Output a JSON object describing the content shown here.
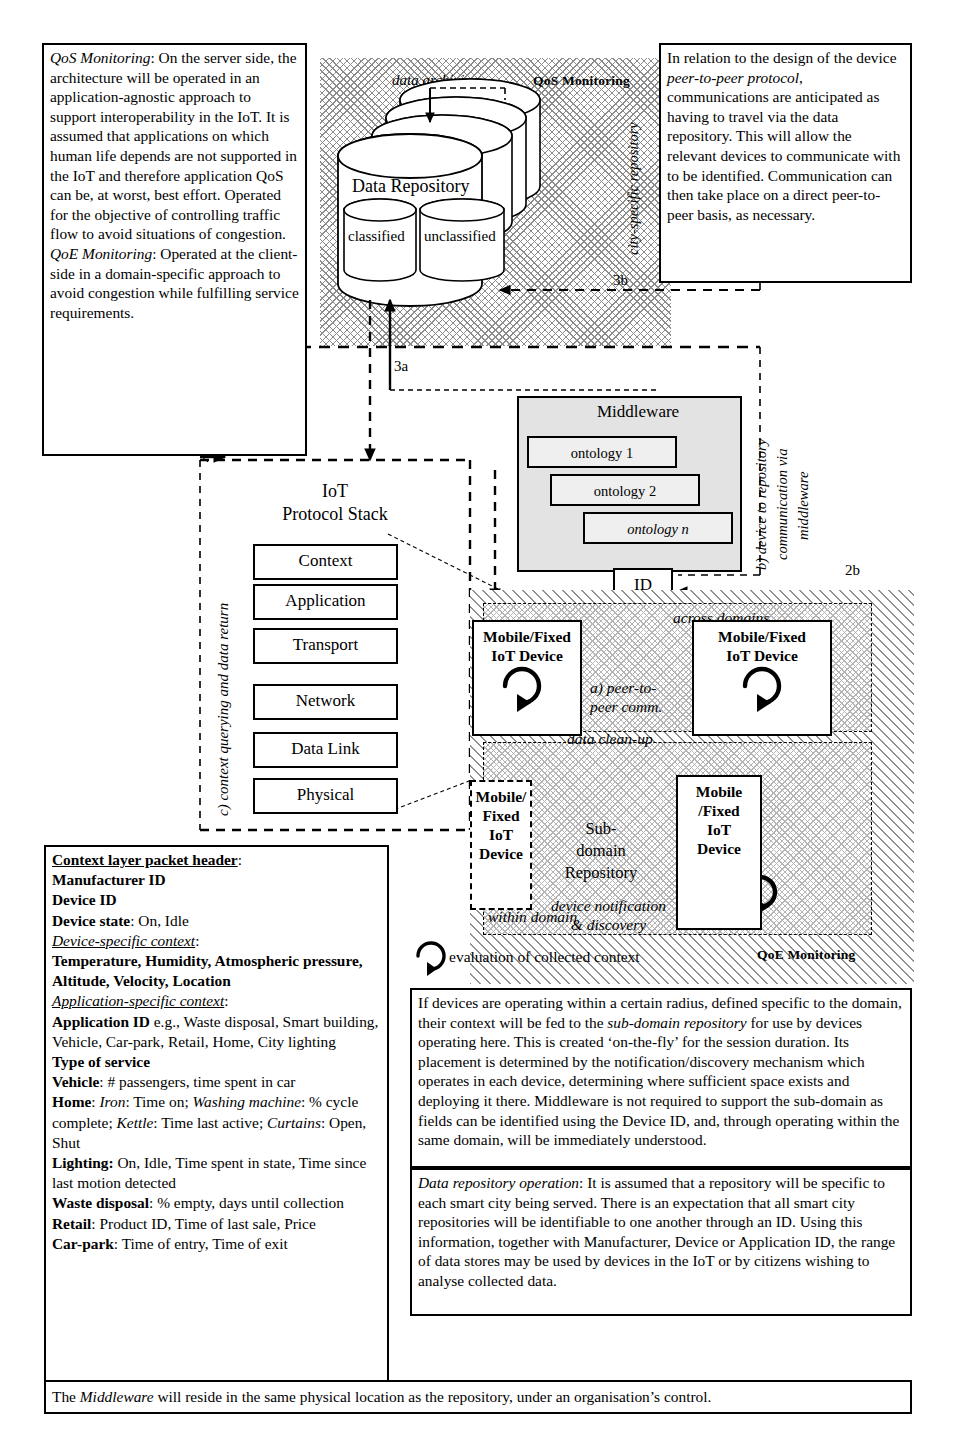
{
  "regions": {
    "qos_label": "QoS Monitoring",
    "qoe_label": "QoE Monitoring",
    "across_domains": "across domains",
    "within_domain": "within domain"
  },
  "repository": {
    "title": "Data Repository",
    "classified": "classified",
    "unclassified": "unclassified",
    "data_archiving": "data archiving",
    "city_specific": "city-specific repository",
    "sub_domain": "Sub-domain Repository",
    "sub_domain_line1": "Sub-domain",
    "sub_domain_line2": "Repository",
    "data_cleanup": "data clean-up"
  },
  "middleware": {
    "title": "Middleware",
    "ontologies": [
      "ontology 1",
      "ontology 2",
      "ontology n"
    ],
    "id_box": "ID",
    "vlabel_1": "b) device to repository",
    "vlabel_2": "communication via",
    "vlabel_3": "middleware"
  },
  "stack": {
    "title_line1": "IoT",
    "title_line2": "Protocol Stack",
    "layers": [
      "Context",
      "Application",
      "Transport",
      "Network",
      "Data Link",
      "Physical"
    ],
    "vlabel": "c) context querying and data return"
  },
  "devices": {
    "top_left_line1": "Mobile/Fixed",
    "top_left_line2": "IoT Device",
    "top_right_line1": "Mobile/Fixed",
    "top_right_line2": "IoT Device",
    "bottom_left_lines": "Mobile/ Fixed IoT Device",
    "bottom_left": [
      "Mobile/",
      "Fixed",
      "IoT",
      "Device"
    ],
    "bottom_right": [
      "Mobile",
      "/Fixed",
      "IoT",
      "Device"
    ],
    "peer_to_peer_line1": "a) peer-to-",
    "peer_to_peer_line2": "peer comm.",
    "notification_line1": "device notification",
    "notification_line2": "& discovery",
    "evaluation": "evaluation of collected context"
  },
  "markers": {
    "m1a": "1",
    "m1b": "1",
    "m2a": "2a",
    "m2b": "2b",
    "m3a": "3a",
    "m3b": "3b"
  },
  "notes": {
    "qos_qoe": {
      "p1_lead": "QoS Monitoring",
      "p1_body": ": On the server side, the architecture will be operated in an application-agnostic approach to support interoperability in the IoT. It is assumed that applications on which human life depends are not supported in the IoT and therefore application QoS can be, at worst, best effort. Operated for the objective of controlling traffic flow to avoid situations of congestion.",
      "p2_lead": "QoE Monitoring",
      "p2_body": ": Operated at the client-side in a domain-specific approach to avoid congestion while fulfilling service requirements."
    },
    "peer_protocol": {
      "part1": "In relation to the design of the device ",
      "em": "peer-to-peer protocol",
      "part2": ", communications are anticipated as having to travel via the data repository. This will allow the relevant devices to communicate with to be identified. Communication can then take place on a direct peer-to-peer basis, as necessary."
    },
    "sub_domain": {
      "part1": "If devices are operating within a certain radius, defined specific to the domain, their context will be fed to the ",
      "em": "sub-domain repository",
      "part2": " for use by devices operating here. This is created ‘on-the-fly’ for the session duration. Its placement is determined by the notification/discovery mechanism which operates in each device, determining where sufficient space exists and deploying it there. Middleware is not required to support the sub-domain as fields can be identified using the Device ID, and, through operating within the same domain, will be immediately understood."
    },
    "repo_operation": {
      "em": "Data repository operation",
      "body": ": It is assumed that a repository will be specific to each smart city being served. There is an expectation that all smart city repositories will be identifiable to one another through an ID. Using this information, together with Manufacturer, Device or Application ID, the range of data stores may be used by devices in the IoT or by citizens wishing to analyse collected data."
    },
    "footer": {
      "part1": "The ",
      "em": "Middleware",
      "part2": " will reside in the same physical location as the repository, under an organisation’s control."
    }
  },
  "packet_header": {
    "title": "Context layer packet header",
    "rows": [
      {
        "label": "Manufacturer ID",
        "value": ""
      },
      {
        "label": "Device ID",
        "value": ""
      },
      {
        "label": "Device state",
        "value": ": On, Idle"
      }
    ],
    "device_specific_title": "Device-specific context",
    "device_specific_bold": "Temperature, Humidity, Atmospheric pressure, Altitude, Velocity, Location",
    "app_specific_title": "Application-specific context",
    "app_id_label": "Application ID",
    "app_id_value": " e.g., Waste disposal, Smart building, Vehicle, Car-park, Retail, Home, City lighting",
    "type_of_service": "Type of service",
    "vehicle_label": "Vehicle",
    "vehicle_value": ": # passengers, time spent in car",
    "home_label": "Home",
    "home_iron": "Iron",
    "home_iron_val": ": Time on; ",
    "home_washing": "Washing machine",
    "home_washing_val": ": % cycle complete; ",
    "home_kettle": "Kettle",
    "home_kettle_val": ": Time last active; ",
    "home_curtains": "Curtains",
    "home_curtains_val": ": Open, Shut",
    "lighting_label": "Lighting:",
    "lighting_value": " On, Idle, Time spent in state, Time since last motion detected",
    "waste_label": "Waste disposal",
    "waste_value": ": % empty, days until collection",
    "retail_label": "Retail",
    "retail_value": ": Product ID, Time of last sale, Price",
    "carpark_label": "Car-park",
    "carpark_value": ": Time of entry, Time of exit"
  }
}
